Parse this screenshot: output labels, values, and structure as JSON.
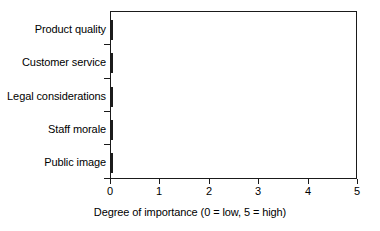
{
  "chart_data": {
    "type": "bar",
    "orientation": "horizontal",
    "title": "",
    "xlabel": "Degree of importance (0 = low, 5 = high)",
    "ylabel": "",
    "xlim": [
      0,
      5
    ],
    "xticks": [
      "0",
      "1",
      "2",
      "3",
      "4",
      "5"
    ],
    "grid": false,
    "legend": false,
    "categories": [
      "Product quality",
      "Customer service",
      "Legal considerations",
      "Staff morale",
      "Public image"
    ],
    "values": [
      3.95,
      3.8,
      3.7,
      3.65,
      2.8
    ],
    "bar_color": "#a9a9a9",
    "bar_border_color": "#1c1c1c",
    "axis_color": "#1a1a1a"
  }
}
